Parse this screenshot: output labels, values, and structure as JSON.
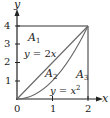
{
  "diagram": {
    "axes": {
      "x_label": "x",
      "y_label": "y",
      "x_ticks": [
        "0",
        "1",
        "2"
      ],
      "y_ticks": [
        "1",
        "2",
        "3",
        "4"
      ],
      "x_range": [
        0,
        2
      ],
      "y_range": [
        0,
        4
      ]
    },
    "regions": {
      "a1": {
        "letter": "A",
        "sub": "1"
      },
      "a2": {
        "letter": "A",
        "sub": "2"
      },
      "a3": {
        "letter": "A",
        "sub": "3"
      }
    },
    "curves": {
      "line": {
        "lhs": "y",
        "eq": " = 2",
        "var": "x"
      },
      "parabola": {
        "lhs": "y",
        "eq": " = ",
        "var": "x",
        "exp": "2"
      }
    },
    "colors": {
      "axis": "#222222",
      "curve": "#666666",
      "box": "#333333"
    }
  }
}
